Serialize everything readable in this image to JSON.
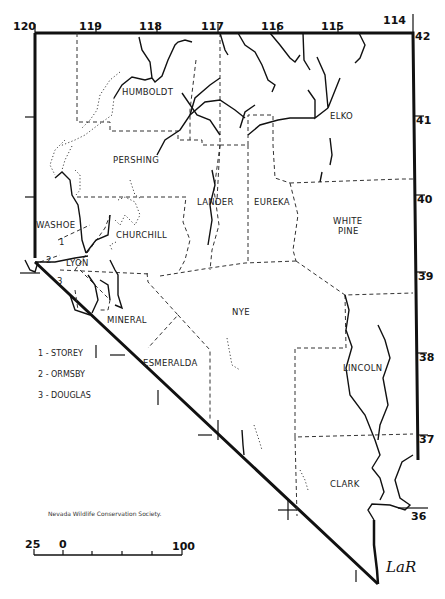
{
  "map": {
    "title": "Nevada counties",
    "credit": "Nevada Wildlife Conservation Society.",
    "signature": "LaR",
    "longitudes": [
      {
        "label": "120",
        "x": 35
      },
      {
        "label": "119",
        "x": 96
      },
      {
        "label": "118",
        "x": 157
      },
      {
        "label": "117",
        "x": 218
      },
      {
        "label": "116",
        "x": 278
      },
      {
        "label": "115",
        "x": 338
      },
      {
        "label": "114",
        "x": 413
      }
    ],
    "latitudes": [
      {
        "label": "42",
        "y": 33
      },
      {
        "label": "41",
        "y": 116
      },
      {
        "label": "40",
        "y": 195
      },
      {
        "label": "39",
        "y": 272
      },
      {
        "label": "38",
        "y": 353
      },
      {
        "label": "37",
        "y": 435
      },
      {
        "label": "36",
        "y": 508
      }
    ],
    "counties": {
      "humboldt": "HUMBOLDT",
      "elko": "ELKO",
      "pershing": "PERSHING",
      "lander": "LANDER",
      "eureka": "EUREKA",
      "white_pine_1": "WHITE",
      "white_pine_2": "PINE",
      "washoe": "WASHOE",
      "churchill": "CHURCHILL",
      "lyon": "LYON",
      "mineral": "MINERAL",
      "nye": "NYE",
      "esmeralda": "ESMERALDA",
      "lincoln": "LINCOLN",
      "clark": "CLARK",
      "num1": "1",
      "num2": "2",
      "num3": "3"
    },
    "legend": [
      "1 - STOREY",
      "2 - ORMSBY",
      "3 - DOUGLAS"
    ],
    "scale": {
      "left": "25",
      "zero": "0",
      "right": "100",
      "unit": "miles"
    }
  }
}
